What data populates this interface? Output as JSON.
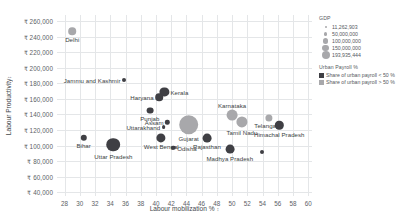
{
  "chart_data": {
    "type": "scatter",
    "title": "",
    "xlabel": "Labour mobilization %",
    "ylabel": "Labour Productivity",
    "xlabel_sortmark": "↕",
    "ylabel_sortmark": "↕",
    "xlim": [
      27,
      60.5
    ],
    "ylim": [
      35000,
      268000
    ],
    "xticks": [
      28,
      30,
      32,
      34,
      36,
      38,
      40,
      42,
      44,
      46,
      48,
      50,
      52,
      54,
      56,
      58,
      60
    ],
    "yticks": [
      40000,
      60000,
      80000,
      100000,
      120000,
      140000,
      160000,
      180000,
      200000,
      220000,
      240000,
      260000
    ],
    "ytick_labels": [
      "₹ 40,000",
      "₹ 60,000",
      "₹ 80,000",
      "₹ 100,000",
      "₹ 120,000",
      "₹ 140,000",
      "₹ 160,000",
      "₹ 180,000",
      "₹ 200,000",
      "₹ 220,000",
      "₹ 240,000",
      "₹ 260,000"
    ],
    "grid": true,
    "size_encoding": "GDP",
    "color_encoding": "Urban Payroll %",
    "points": [
      {
        "label": "Delhi",
        "x": 29.0,
        "y": 247000,
        "size": 3.8,
        "color": "light",
        "label_pos": "b"
      },
      {
        "label": "Jammu and Kashmir",
        "x": 35.8,
        "y": 184000,
        "size": 2.0,
        "color": "dark",
        "label_pos": "r"
      },
      {
        "label": "Kerala",
        "x": 41.1,
        "y": 169000,
        "size": 4.6,
        "color": "dark",
        "label_pos": "l"
      },
      {
        "label": "Haryana",
        "x": 40.4,
        "y": 162000,
        "size": 3.8,
        "color": "dark",
        "label_pos": "r"
      },
      {
        "label": "Punjab",
        "x": 39.2,
        "y": 145000,
        "size": 3.4,
        "color": "dark",
        "label_pos": "b"
      },
      {
        "label": "Karnataka",
        "x": 50.0,
        "y": 139000,
        "size": 5.4,
        "color": "light",
        "label_pos": "t"
      },
      {
        "label": "Telangana",
        "x": 54.8,
        "y": 136000,
        "size": 3.6,
        "color": "light",
        "label_pos": "b"
      },
      {
        "label": "Assam",
        "x": 41.5,
        "y": 130000,
        "size": 2.2,
        "color": "dark",
        "label_pos": "r"
      },
      {
        "label": "Gujarat",
        "x": 44.3,
        "y": 127000,
        "size": 9.8,
        "color": "light",
        "label_pos": "b"
      },
      {
        "label": "Tamil Nadu",
        "x": 51.3,
        "y": 130000,
        "size": 5.6,
        "color": "light",
        "label_pos": "b"
      },
      {
        "label": "Uttarakhand",
        "x": 41.0,
        "y": 124000,
        "size": 1.9,
        "color": "dark",
        "label_pos": "r"
      },
      {
        "label": "Himachal Pradesh",
        "x": 56.2,
        "y": 126000,
        "size": 4.2,
        "color": "dark",
        "label_pos": "b"
      },
      {
        "label": "Bihar",
        "x": 30.5,
        "y": 110000,
        "size": 3.2,
        "color": "dark",
        "label_pos": "b"
      },
      {
        "label": "West Bengal",
        "x": 40.7,
        "y": 110000,
        "size": 4.6,
        "color": "dark",
        "label_pos": "b"
      },
      {
        "label": "Rajasthan",
        "x": 46.7,
        "y": 110000,
        "size": 4.4,
        "color": "dark",
        "label_pos": "b"
      },
      {
        "label": "Uttar Pradesh",
        "x": 34.4,
        "y": 101000,
        "size": 6.8,
        "color": "dark",
        "label_pos": "b"
      },
      {
        "label": "Odisha",
        "x": 42.3,
        "y": 97000,
        "size": 2.2,
        "color": "dark",
        "label_pos": "l"
      },
      {
        "label": "Madhya Pradesh",
        "x": 49.7,
        "y": 95000,
        "size": 4.4,
        "color": "dark",
        "label_pos": "b"
      },
      {
        "label": "",
        "x": 53.9,
        "y": 92000,
        "size": 2.0,
        "color": "dark",
        "label_pos": "b"
      }
    ]
  },
  "legend": {
    "size_group": {
      "title": "GDP",
      "items": [
        {
          "value": "11,262,903",
          "bubble": 2.0
        },
        {
          "value": "50,000,000",
          "bubble": 3.6
        },
        {
          "value": "100,000,000",
          "bubble": 5.2
        },
        {
          "value": "150,000,000",
          "bubble": 6.6
        },
        {
          "value": "193,935,444",
          "bubble": 8.0
        }
      ]
    },
    "color_group": {
      "title": "Urban Payroll %",
      "items": [
        {
          "label": "Share of urban payroll < 50 %",
          "color": "#3f3f44"
        },
        {
          "label": "Share of urban payroll > 50 %",
          "color": "#a8a8ab"
        }
      ]
    }
  }
}
